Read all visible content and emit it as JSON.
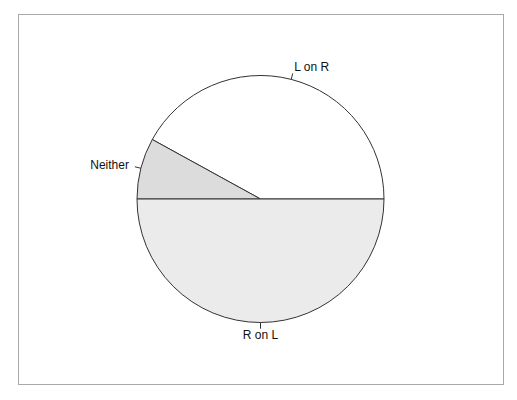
{
  "chart_data": {
    "type": "pie",
    "title": "",
    "categories": [
      "L on R",
      "Neither",
      "R on L"
    ],
    "values": [
      42,
      8,
      50
    ],
    "unit": "percent (estimated from angles)",
    "start_angle_deg": 0,
    "direction": "counterclockwise",
    "colors": [
      "#ffffff",
      "#dcdcdc",
      "#ebebeb"
    ],
    "legend": "none (direct slice labels)",
    "labels": [
      {
        "text": "L on R",
        "slice": 0
      },
      {
        "text": "Neither",
        "slice": 1
      },
      {
        "text": "R on L",
        "slice": 2
      }
    ]
  },
  "labels": {
    "l_on_r": "L on R",
    "neither": "Neither",
    "r_on_l": "R on L"
  }
}
